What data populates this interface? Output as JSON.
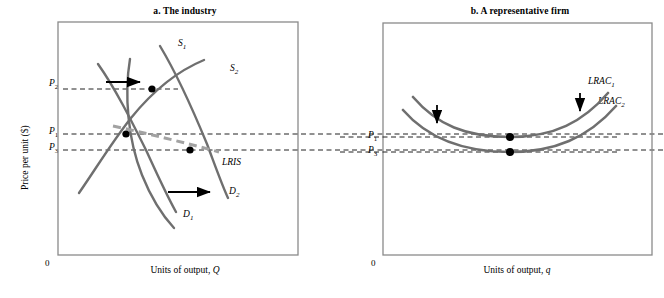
{
  "figure": {
    "kind": "economics-diagram",
    "colors": {
      "curve_gray": "#6f6f6f",
      "lris_gray": "#a0a0a0",
      "dash_black": "#000000",
      "frame_gray": "#808080",
      "dot_black": "#000000"
    }
  },
  "panel_a": {
    "title": "a. The industry",
    "x_axis_label": "Units of output, Q",
    "x_axis_label_italic": "Q",
    "y_axis_label": "Price per unit ($)",
    "origin": "0",
    "price_labels": [
      {
        "id": "P2",
        "base": "P",
        "sub": "2",
        "value_y_px": 85
      },
      {
        "id": "P1",
        "base": "P",
        "sub": "1",
        "value_y_px": 133
      },
      {
        "id": "P3",
        "base": "P",
        "sub": "3",
        "value_y_px": 149
      }
    ],
    "curve_labels": [
      {
        "id": "S1",
        "base": "S",
        "sub": "1"
      },
      {
        "id": "S2",
        "base": "S",
        "sub": "2"
      },
      {
        "id": "D1",
        "base": "D",
        "sub": "1"
      },
      {
        "id": "D2",
        "base": "D",
        "sub": "2"
      },
      {
        "id": "LRIS",
        "base": "LRIS",
        "sub": ""
      }
    ],
    "equilibrium_points": [
      {
        "id": "e1",
        "label": "P1 equilibrium",
        "x_px": 126,
        "y_px": 134
      },
      {
        "id": "e2",
        "label": "P2 equilibrium",
        "x_px": 152,
        "y_px": 89
      },
      {
        "id": "e3",
        "label": "P3 equilibrium",
        "x_px": 190,
        "y_px": 150
      }
    ],
    "arrows": [
      {
        "id": "supply-shift-arrow",
        "direction": "right"
      },
      {
        "id": "demand-shift-arrow",
        "direction": "right"
      }
    ]
  },
  "panel_b": {
    "title": "b. A representative firm",
    "x_axis_label": "Units of output, q",
    "x_axis_label_italic": "q",
    "origin": "0",
    "price_labels": [
      {
        "id": "P1",
        "base": "P",
        "sub": "1",
        "value_y_px": 137
      },
      {
        "id": "P3",
        "base": "P",
        "sub": "3",
        "value_y_px": 152
      }
    ],
    "curve_labels": [
      {
        "id": "LRAC1",
        "base": "LRAC",
        "sub": "1"
      },
      {
        "id": "LRAC2",
        "base": "LRAC",
        "sub": "2"
      }
    ],
    "equilibrium_points": [
      {
        "id": "f1",
        "label": "LRAC1 minimum",
        "x_px": 510,
        "y_px": 137
      },
      {
        "id": "f2",
        "label": "LRAC2 minimum",
        "x_px": 510,
        "y_px": 152
      }
    ],
    "arrows": [
      {
        "id": "lrac-shift-arrow-left",
        "direction": "down"
      },
      {
        "id": "lrac-shift-arrow-right",
        "direction": "down"
      }
    ]
  }
}
